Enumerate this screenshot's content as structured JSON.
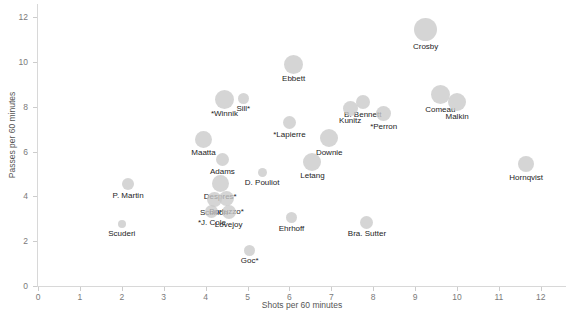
{
  "chart_data": {
    "type": "scatter",
    "title": "",
    "subtitle": "",
    "xlabel": "Shots per 60 minutes",
    "ylabel": "Passes per 60 minutes",
    "xlim": [
      0,
      12.6
    ],
    "ylim": [
      0,
      12.6
    ],
    "xticks": [
      0,
      1,
      2,
      3,
      4,
      5,
      6,
      7,
      8,
      9,
      10,
      11,
      12
    ],
    "yticks": [
      0,
      2,
      4,
      6,
      8,
      10,
      12
    ],
    "grid": false,
    "legend": "none",
    "bubble_color": "#c9c9c9",
    "points": [
      {
        "label": "Crosby",
        "x": 9.25,
        "y": 11.45,
        "size": 11.5
      },
      {
        "label": "Ebbett",
        "x": 6.1,
        "y": 9.9,
        "size": 9.5
      },
      {
        "label": "*Winnik",
        "x": 4.45,
        "y": 8.35,
        "size": 9.5
      },
      {
        "label": "Sill*",
        "x": 4.9,
        "y": 8.4,
        "size": 5.5
      },
      {
        "label": "Comeau",
        "x": 9.6,
        "y": 8.55,
        "size": 9.5
      },
      {
        "label": "Malkin",
        "x": 10.0,
        "y": 8.2,
        "size": 9.0
      },
      {
        "label": "B. Bennett",
        "x": 7.75,
        "y": 8.2,
        "size": 7.0
      },
      {
        "label": "Kunitz",
        "x": 7.45,
        "y": 7.95,
        "size": 7.5
      },
      {
        "label": "*Perron",
        "x": 8.25,
        "y": 7.7,
        "size": 7.5
      },
      {
        "label": "*Lapierre",
        "x": 6.0,
        "y": 7.3,
        "size": 6.5
      },
      {
        "label": "Maatta",
        "x": 3.95,
        "y": 6.55,
        "size": 8.5
      },
      {
        "label": "Downie",
        "x": 6.95,
        "y": 6.6,
        "size": 9.0
      },
      {
        "label": "Adams",
        "x": 4.4,
        "y": 5.65,
        "size": 6.5
      },
      {
        "label": "Letang",
        "x": 6.55,
        "y": 5.55,
        "size": 9.0
      },
      {
        "label": "D. Pouliot",
        "x": 5.35,
        "y": 5.05,
        "size": 4.5
      },
      {
        "label": "Hornqvist",
        "x": 11.65,
        "y": 5.45,
        "size": 8.0
      },
      {
        "label": "Despres*",
        "x": 4.35,
        "y": 4.6,
        "size": 8.5
      },
      {
        "label": "P. Martin",
        "x": 2.15,
        "y": 4.55,
        "size": 6.0
      },
      {
        "label": "Scuillon",
        "x": 4.2,
        "y": 3.85,
        "size": 7.5
      },
      {
        "label": "Bortuzzo*",
        "x": 4.5,
        "y": 3.9,
        "size": 7.5
      },
      {
        "label": "*J. Cole",
        "x": 4.15,
        "y": 3.35,
        "size": 6.5
      },
      {
        "label": "Lovejoy",
        "x": 4.55,
        "y": 3.3,
        "size": 7.0
      },
      {
        "label": "Ehrhoff",
        "x": 6.05,
        "y": 3.05,
        "size": 5.5
      },
      {
        "label": "Bra. Sutter",
        "x": 7.85,
        "y": 2.85,
        "size": 6.5
      },
      {
        "label": "Scuderi",
        "x": 2.0,
        "y": 2.75,
        "size": 4.0
      },
      {
        "label": "Goc*",
        "x": 5.05,
        "y": 1.6,
        "size": 5.5
      }
    ]
  },
  "labels": {
    "0": "Crosby",
    "1": "Ebbett",
    "2": "*Winnik",
    "3": "Sill*",
    "4": "Comeau",
    "5": "Malkin",
    "6": "B. Bennett",
    "7": "Kunitz",
    "8": "*Perron",
    "9": "*Lapierre",
    "10": "Maatta",
    "11": "Downie",
    "12": "Adams",
    "13": "Letang",
    "14": "D. Pouliot",
    "15": "Hornqvist",
    "16": "Despres*",
    "17": "P. Martin",
    "18": "Scuillon",
    "19": "Bortuzzo*",
    "20": "*J. Cole",
    "21": "Lovejoy",
    "22": "Ehrhoff",
    "23": "Bra. Sutter",
    "24": "Scuderi",
    "25": "Goc*"
  }
}
